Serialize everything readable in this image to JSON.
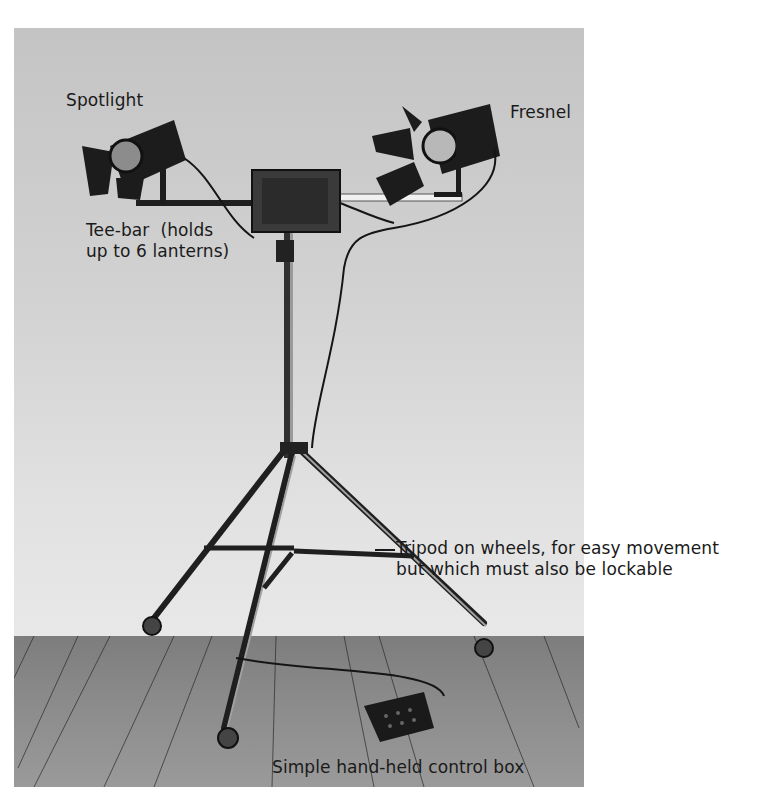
{
  "figure": {
    "labels": {
      "spotlight": "Spotlight",
      "fresnel": "Fresnel",
      "tee_bar_line1": "Tee-bar  (holds",
      "tee_bar_line2": "up to 6 lanterns)",
      "tripod_line1": "Tripod on wheels, for easy movement",
      "tripod_line2": "but which must also be lockable",
      "control_box": "Simple hand-held control box"
    },
    "colors": {
      "wall": "#d2d2d2",
      "floor": "#8a8a8a",
      "equipment": "#1e1e1e",
      "text": "#1a1a1a"
    }
  }
}
